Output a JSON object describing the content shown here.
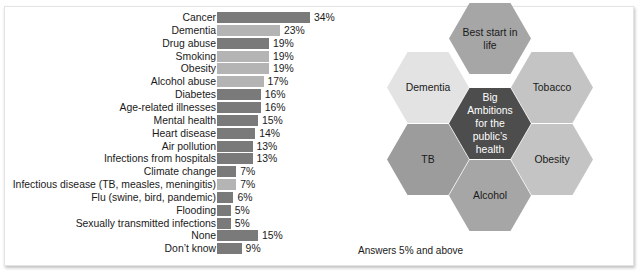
{
  "chart_data": {
    "type": "bar",
    "orientation": "horizontal",
    "title": "",
    "xlabel": "",
    "ylabel": "",
    "value_suffix": "%",
    "categories": [
      "Cancer",
      "Dementia",
      "Drug abuse",
      "Smoking",
      "Obesity",
      "Alcohol abuse",
      "Diabetes",
      "Age-related illnesses",
      "Mental health",
      "Heart disease",
      "Air pollution",
      "Infections from hospitals",
      "Climate change",
      "Infectious disease (TB, measles, meningitis)",
      "Flu (swine, bird, pandemic)",
      "Flooding",
      "Sexually transmitted infections",
      "None",
      "Don't know"
    ],
    "values": [
      34,
      23,
      19,
      19,
      19,
      17,
      16,
      16,
      15,
      14,
      13,
      13,
      7,
      7,
      6,
      5,
      5,
      15,
      9
    ],
    "highlighted": [
      false,
      true,
      false,
      true,
      true,
      true,
      false,
      false,
      false,
      false,
      false,
      false,
      false,
      true,
      false,
      false,
      false,
      false,
      false
    ],
    "colors": {
      "default": "#7a7a7a",
      "highlight": "#b4b4b4"
    },
    "grid": false,
    "legend": null
  },
  "labels": {
    "rows": [
      {
        "label": "Cancer",
        "value": "34%"
      },
      {
        "label": "Dementia",
        "value": "23%"
      },
      {
        "label": "Drug abuse",
        "value": "19%"
      },
      {
        "label": "Smoking",
        "value": "19%"
      },
      {
        "label": "Obesity",
        "value": "19%"
      },
      {
        "label": "Alcohol abuse",
        "value": "17%"
      },
      {
        "label": "Diabetes",
        "value": "16%"
      },
      {
        "label": "Age-related illnesses",
        "value": "16%"
      },
      {
        "label": "Mental health",
        "value": "15%"
      },
      {
        "label": "Heart disease",
        "value": "14%"
      },
      {
        "label": "Air pollution",
        "value": "13%"
      },
      {
        "label": "Infections from hospitals",
        "value": "13%"
      },
      {
        "label": "Climate change",
        "value": "7%"
      },
      {
        "label": "Infectious disease (TB, measles, meningitis)",
        "value": "7%"
      },
      {
        "label": "Flu (swine, bird, pandemic)",
        "value": "6%"
      },
      {
        "label": "Flooding",
        "value": "5%"
      },
      {
        "label": "Sexually transmitted infections",
        "value": "5%"
      },
      {
        "label": "None",
        "value": "15%"
      },
      {
        "label": "Don’t know",
        "value": "9%"
      }
    ]
  },
  "hexagons": {
    "center": {
      "text": "Big Ambitions for the public’s health",
      "color": "#4d4d4d",
      "text_color": "#ffffff"
    },
    "top": {
      "text": "Best start in life",
      "color": "#a6a6a6"
    },
    "upper_left": {
      "text": "Dementia",
      "color": "#e3e3e3"
    },
    "upper_right": {
      "text": "Tobacco",
      "color": "#c4c4c4"
    },
    "lower_left": {
      "text": "TB",
      "color": "#9c9c9c"
    },
    "lower_right": {
      "text": "Obesity",
      "color": "#c4c4c4"
    },
    "bottom": {
      "text": "Alcohol",
      "color": "#a6a6a6"
    }
  },
  "footnote": "Answers 5% and above"
}
